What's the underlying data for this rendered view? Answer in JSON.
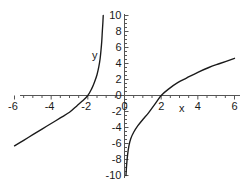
{
  "chart_data": {
    "type": "line",
    "title": "",
    "xlabel": "x",
    "ylabel": "y",
    "xlim": [
      -6,
      6
    ],
    "ylim": [
      -10,
      10
    ],
    "grid": false,
    "legend": null,
    "xticks": [
      -6,
      -4,
      -2,
      0,
      2,
      4,
      6
    ],
    "xtick_labels": [
      "-6",
      "-4",
      "-2",
      "0",
      "2",
      "4",
      "6"
    ],
    "yticks": [
      -10,
      -8,
      -6,
      -4,
      -2,
      0,
      2,
      4,
      6,
      8,
      10
    ],
    "ytick_labels": [
      "-10",
      "-8",
      "-6",
      "-4",
      "-2",
      "0",
      "2",
      "4",
      "6",
      "8",
      "10"
    ],
    "minor_tick_step": 0.5,
    "axis_color": "#555555",
    "curve_color": "#1a1a1a",
    "series": [
      {
        "name": "left-branch",
        "note": "rises from lower-left through x-intercept at (-2, 0) toward vertical asymptote near x = -1.1",
        "x_intercept": -2,
        "vertical_asymptote": -1.1,
        "points": [
          [
            -6.0,
            -6.3
          ],
          [
            -5.5,
            -5.6
          ],
          [
            -5.0,
            -4.9
          ],
          [
            -4.5,
            -4.2
          ],
          [
            -4.0,
            -3.5
          ],
          [
            -3.5,
            -2.8
          ],
          [
            -3.0,
            -2.1
          ],
          [
            -2.6,
            -1.3
          ],
          [
            -2.3,
            -0.7
          ],
          [
            -2.0,
            0.0
          ],
          [
            -1.8,
            0.8
          ],
          [
            -1.65,
            1.6
          ],
          [
            -1.5,
            2.6
          ],
          [
            -1.4,
            3.6
          ],
          [
            -1.33,
            4.6
          ],
          [
            -1.28,
            5.7
          ],
          [
            -1.24,
            6.8
          ],
          [
            -1.21,
            8.0
          ],
          [
            -1.18,
            9.1
          ],
          [
            -1.16,
            10.0
          ]
        ]
      },
      {
        "name": "right-branch",
        "note": "rises from vertical asymptote near x = 0 through x-intercept at (2, 0) to upper right",
        "x_intercept": 2,
        "vertical_asymptote": 0.05,
        "points": [
          [
            0.08,
            -10.0
          ],
          [
            0.12,
            -8.6
          ],
          [
            0.17,
            -7.4
          ],
          [
            0.24,
            -6.3
          ],
          [
            0.34,
            -5.4
          ],
          [
            0.5,
            -4.6
          ],
          [
            0.72,
            -3.8
          ],
          [
            1.0,
            -3.0
          ],
          [
            1.3,
            -2.2
          ],
          [
            1.65,
            -1.1
          ],
          [
            2.0,
            0.0
          ],
          [
            2.4,
            0.8
          ],
          [
            2.9,
            1.6
          ],
          [
            3.4,
            2.2
          ],
          [
            4.0,
            2.9
          ],
          [
            4.6,
            3.5
          ],
          [
            5.2,
            4.0
          ],
          [
            6.0,
            4.65
          ]
        ]
      }
    ]
  },
  "annotations": {
    "y_axis_name": "y",
    "x_axis_name": "x"
  }
}
